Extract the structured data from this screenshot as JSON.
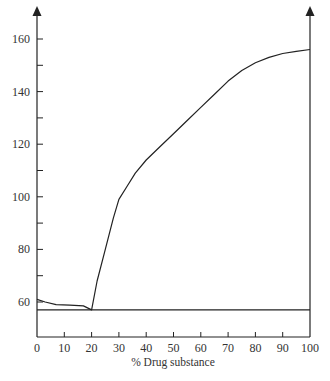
{
  "chart_data": {
    "type": "line",
    "title": "",
    "xlabel": "% Drug substance",
    "ylabel": "",
    "xlim": [
      0,
      100
    ],
    "ylim": [
      48,
      168
    ],
    "grid": false,
    "legend": null,
    "x_ticks": [
      0,
      10,
      20,
      30,
      40,
      50,
      60,
      70,
      80,
      90,
      100
    ],
    "y_ticks_labeled": [
      60,
      80,
      100,
      120,
      140,
      160
    ],
    "y_ticks_minor": [
      70,
      90,
      110,
      130,
      150
    ],
    "series": [
      {
        "name": "Curve",
        "x": [
          0,
          3,
          7,
          12,
          17,
          20,
          22,
          25,
          28,
          30,
          33,
          36,
          40,
          45,
          50,
          55,
          60,
          65,
          70,
          75,
          80,
          85,
          90,
          95,
          100
        ],
        "y": [
          61,
          60,
          59,
          58.8,
          58.5,
          57,
          68,
          80,
          92,
          99,
          104,
          109,
          114,
          119,
          124,
          129,
          134,
          139,
          144,
          148,
          151,
          153,
          154.5,
          155.3,
          156
        ]
      },
      {
        "name": "Baseline",
        "x": [
          0,
          100
        ],
        "y": [
          57,
          57
        ]
      }
    ],
    "annotations": []
  }
}
